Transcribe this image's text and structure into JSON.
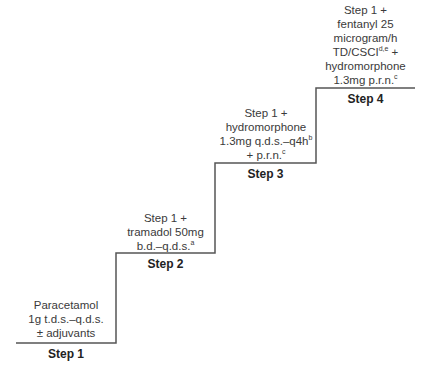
{
  "diagram": {
    "type": "analgesic-ladder-staircase",
    "steps": [
      {
        "label": "Step 1",
        "lines": [
          {
            "text": "Paracetamol",
            "sup": ""
          },
          {
            "text": "1g t.d.s.–q.d.s.",
            "sup": ""
          },
          {
            "text": "± adjuvants",
            "sup": ""
          }
        ]
      },
      {
        "label": "Step 2",
        "lines": [
          {
            "text": "Step 1 +",
            "sup": ""
          },
          {
            "text": "tramadol 50mg",
            "sup": ""
          },
          {
            "text": "b.d.–q.d.s.",
            "sup": "a"
          }
        ]
      },
      {
        "label": "Step 3",
        "lines": [
          {
            "text": "Step 1 +",
            "sup": ""
          },
          {
            "text": "hydromorphone",
            "sup": ""
          },
          {
            "text": "1.3mg q.d.s.–q4h",
            "sup": "b"
          },
          {
            "text": "+ p.r.n.",
            "sup": "c"
          }
        ]
      },
      {
        "label": "Step 4",
        "lines": [
          {
            "text": "Step 1 +",
            "sup": ""
          },
          {
            "text": "fentanyl 25",
            "sup": ""
          },
          {
            "text": "microgram/h",
            "sup": ""
          },
          {
            "text": "TD/CSCI",
            "sup": "d,e",
            "after": " +"
          },
          {
            "text": "hydromorphone",
            "sup": ""
          },
          {
            "text": "1.3mg p.r.n.",
            "sup": "c"
          }
        ]
      }
    ],
    "line_color": "#444444"
  }
}
